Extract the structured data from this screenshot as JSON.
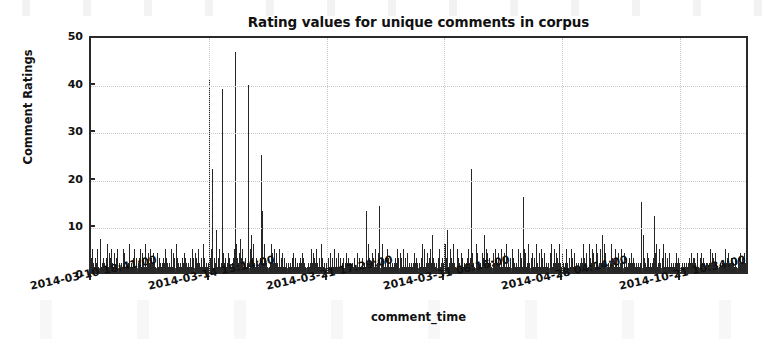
{
  "chart_data": {
    "type": "bar",
    "title": "Rating values for unique comments in corpus",
    "xlabel": "comment_time",
    "ylabel": "Comment Ratings",
    "ylim": [
      0,
      50
    ],
    "yticks": [
      0,
      10,
      20,
      30,
      40,
      50
    ],
    "ytick_labels": [
      "0",
      "10",
      "20",
      "30",
      "40",
      "50"
    ],
    "grid": true,
    "legend": "none",
    "bar_color": "#262626",
    "axes_color": "#2a2a2a",
    "grid_color": "#c9c9c9",
    "background": "#ffffff",
    "xtick_positions": [
      0.0,
      0.179,
      0.358,
      0.536,
      0.715,
      0.894
    ],
    "xtick_labels": [
      "2014-03-10 18:41:00",
      "2014-03-14 15:14:00",
      "2014-03-21 17:29:00",
      "2014-03-31 06:16:00",
      "2014-04-28 04:14:00",
      "2014-10-21 10:34:00"
    ],
    "xlim_note": "comment_time ordinal index, 6 evenly spaced labeled ticks",
    "series_name": "Comment Ratings",
    "values": [
      3,
      21,
      5,
      2,
      4,
      1,
      3,
      6,
      2,
      5,
      3,
      1,
      4,
      2,
      7,
      3,
      1,
      2,
      5,
      3,
      2,
      4,
      1,
      3,
      2,
      6,
      1,
      2,
      4,
      3,
      1,
      5,
      2,
      3,
      1,
      4,
      2,
      1,
      3,
      2,
      5,
      1,
      3,
      2,
      4,
      1,
      2,
      3,
      1,
      5,
      2,
      4,
      1,
      3,
      2,
      1,
      4,
      2,
      6,
      3,
      1,
      2,
      4,
      1,
      3,
      2,
      5,
      1,
      2,
      3,
      1,
      4,
      2,
      1,
      3,
      5,
      2,
      1,
      4,
      2,
      3,
      1,
      2,
      6,
      1,
      3,
      2,
      4,
      1,
      2,
      5,
      1,
      3,
      2,
      1,
      4,
      2,
      3,
      1,
      2,
      22,
      4,
      2,
      1,
      3,
      5,
      2,
      1,
      4,
      2,
      3,
      1,
      2,
      5,
      1,
      3,
      2,
      4,
      1,
      2,
      3,
      1,
      5,
      2,
      1,
      4,
      2,
      3,
      1,
      2,
      6,
      1,
      3,
      2,
      4,
      1,
      2,
      5,
      1,
      3,
      12,
      2,
      4,
      1,
      3,
      2,
      5,
      1,
      2,
      4,
      1,
      3,
      2,
      1,
      5,
      2,
      3,
      1,
      2,
      4,
      1,
      3,
      2,
      1,
      5,
      2,
      4,
      1,
      3,
      2,
      1,
      6,
      2,
      3,
      1,
      4,
      2,
      1,
      3,
      2,
      41,
      8,
      3,
      5,
      2,
      22,
      4,
      1,
      3,
      6,
      2,
      9,
      4,
      1,
      3,
      2,
      5,
      1,
      4,
      2,
      39,
      12,
      4,
      2,
      7,
      3,
      1,
      5,
      2,
      4,
      1,
      3,
      2,
      6,
      1,
      4,
      2,
      3,
      1,
      5,
      47,
      18,
      6,
      3,
      9,
      2,
      4,
      1,
      7,
      3,
      2,
      5,
      1,
      4,
      2,
      3,
      6,
      1,
      2,
      4,
      40,
      33,
      11,
      5,
      2,
      8,
      3,
      1,
      6,
      2,
      4,
      1,
      3,
      5,
      2,
      1,
      4,
      2,
      3,
      1,
      25,
      13,
      4,
      2,
      6,
      1,
      3,
      2,
      5,
      1,
      4,
      2,
      1,
      3,
      2,
      6,
      1,
      4,
      2,
      3,
      5,
      2,
      1,
      4,
      2,
      3,
      1,
      5,
      2,
      1,
      3,
      2,
      4,
      1,
      2,
      3,
      1,
      5,
      2,
      1,
      4,
      2,
      3,
      1,
      2,
      5,
      1,
      3,
      2,
      4,
      1,
      2,
      3,
      1,
      5,
      2,
      1,
      4,
      2,
      3,
      1,
      2,
      4,
      1,
      3,
      2,
      5,
      1,
      2,
      3,
      1,
      4,
      2,
      1,
      3,
      2,
      5,
      1,
      2,
      4,
      11,
      3,
      2,
      1,
      5,
      2,
      4,
      1,
      3,
      2,
      1,
      6,
      2,
      3,
      1,
      4,
      2,
      1,
      3,
      2,
      2,
      1,
      3,
      2,
      1,
      4,
      2,
      1,
      3,
      2,
      1,
      5,
      2,
      1,
      3,
      2,
      1,
      4,
      2,
      1,
      3,
      2,
      1,
      2,
      1,
      3,
      2,
      1,
      2,
      1,
      4,
      2,
      1,
      3,
      2,
      1,
      2,
      1,
      3,
      2,
      1,
      2,
      3,
      1,
      2,
      1,
      4,
      2,
      1,
      3,
      2,
      1,
      2,
      1,
      3,
      2,
      1,
      2,
      4,
      1,
      13,
      4,
      2,
      6,
      1,
      3,
      2,
      5,
      1,
      4,
      2,
      3,
      1,
      2,
      5,
      1,
      3,
      2,
      4,
      1,
      14,
      5,
      2,
      3,
      1,
      6,
      2,
      4,
      1,
      3,
      2,
      1,
      5,
      2,
      3,
      1,
      4,
      2,
      1,
      3,
      2,
      1,
      4,
      2,
      3,
      1,
      2,
      5,
      1,
      3,
      2,
      1,
      4,
      2,
      3,
      1,
      2,
      5,
      1,
      2,
      3,
      1,
      2,
      4,
      1,
      3,
      2,
      1,
      5,
      2,
      1,
      3,
      2,
      4,
      1,
      2,
      3,
      1,
      2,
      4,
      9,
      2,
      4,
      1,
      3,
      2,
      6,
      1,
      2,
      5,
      1,
      3,
      2,
      4,
      1,
      2,
      3,
      1,
      5,
      2,
      21,
      8,
      3,
      5,
      2,
      1,
      4,
      2,
      6,
      1,
      3,
      2,
      5,
      1,
      4,
      2,
      3,
      1,
      2,
      6,
      19,
      6,
      3,
      2,
      9,
      1,
      4,
      2,
      5,
      1,
      3,
      2,
      1,
      6,
      2,
      4,
      1,
      3,
      2,
      5,
      11,
      3,
      2,
      5,
      1,
      4,
      2,
      3,
      1,
      6,
      2,
      1,
      4,
      2,
      3,
      1,
      5,
      2,
      1,
      3,
      22,
      7,
      4,
      2,
      5,
      1,
      3,
      2,
      6,
      1,
      4,
      2,
      3,
      1,
      2,
      5,
      1,
      4,
      2,
      3,
      8,
      3,
      2,
      5,
      1,
      4,
      2,
      1,
      3,
      2,
      6,
      1,
      3,
      2,
      4,
      1,
      2,
      5,
      1,
      3,
      2,
      1,
      4,
      2,
      3,
      1,
      5,
      2,
      1,
      3,
      2,
      4,
      1,
      2,
      6,
      1,
      3,
      2,
      1,
      4,
      3,
      1,
      2,
      5,
      1,
      3,
      2,
      4,
      1,
      2,
      3,
      1,
      5,
      2,
      1,
      4,
      2,
      3,
      1,
      2,
      16,
      5,
      2,
      4,
      1,
      3,
      2,
      6,
      1,
      2,
      5,
      1,
      3,
      2,
      4,
      1,
      2,
      3,
      1,
      5,
      6,
      2,
      3,
      1,
      4,
      2,
      1,
      5,
      2,
      3,
      1,
      2,
      4,
      1,
      3,
      2,
      1,
      5,
      2,
      1,
      15,
      4,
      2,
      6,
      1,
      3,
      2,
      5,
      1,
      2,
      4,
      1,
      3,
      2,
      1,
      6,
      2,
      3,
      1,
      4,
      4,
      2,
      1,
      3,
      2,
      5,
      1,
      2,
      4,
      1,
      3,
      2,
      1,
      5,
      2,
      3,
      1,
      2,
      4,
      1,
      3,
      2,
      1,
      5,
      2,
      1,
      4,
      2,
      3,
      1,
      2,
      6,
      1,
      3,
      2,
      1,
      4,
      2,
      3,
      1,
      19,
      6,
      3,
      9,
      2,
      5,
      1,
      4,
      2,
      3,
      1,
      6,
      2,
      4,
      1,
      3,
      2,
      5,
      1,
      2,
      8,
      3,
      2,
      6,
      1,
      4,
      2,
      5,
      1,
      3,
      2,
      1,
      4,
      2,
      6,
      1,
      3,
      2,
      4,
      1,
      5,
      2,
      3,
      1,
      2,
      4,
      1,
      3,
      2,
      5,
      1,
      2,
      3,
      1,
      4,
      2,
      1,
      3,
      2,
      1,
      2,
      1,
      3,
      2,
      1,
      4,
      2,
      1,
      3,
      2,
      5,
      1,
      2,
      3,
      1,
      2,
      4,
      1,
      2,
      3,
      15,
      5,
      2,
      8,
      1,
      3,
      2,
      6,
      1,
      4,
      2,
      3,
      1,
      5,
      2,
      1,
      4,
      2,
      3,
      1,
      12,
      4,
      2,
      6,
      1,
      3,
      2,
      5,
      1,
      2,
      4,
      1,
      3,
      2,
      6,
      1,
      2,
      4,
      1,
      3,
      3,
      1,
      2,
      4,
      1,
      3,
      2,
      1,
      5,
      2,
      1,
      3,
      2,
      4,
      1,
      2,
      3,
      1,
      2,
      5,
      2,
      1,
      3,
      2,
      1,
      4,
      2,
      1,
      3,
      2,
      1,
      5,
      2,
      3,
      1,
      2,
      4,
      1,
      2,
      3,
      9,
      3,
      2,
      5,
      1,
      4,
      2,
      1,
      6,
      2,
      3,
      1,
      4,
      2,
      1,
      3,
      2,
      5,
      1,
      2,
      4,
      2,
      1,
      3,
      2,
      5,
      1,
      2,
      4,
      1,
      3,
      2,
      1,
      4,
      2,
      3,
      1,
      2,
      5,
      1,
      3,
      2,
      1,
      4,
      2,
      1,
      3,
      2,
      5,
      1,
      2,
      3,
      1,
      4,
      2,
      1,
      2,
      3,
      1,
      2,
      2,
      4,
      1,
      3,
      2,
      1,
      5,
      2,
      3,
      1,
      2,
      4,
      1,
      2,
      3,
      1,
      2,
      4,
      1,
      2
    ]
  }
}
